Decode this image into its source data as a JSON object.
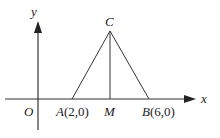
{
  "diagram": {
    "axes": {
      "x_label": "x",
      "y_label": "y",
      "origin_label": "O"
    },
    "points": {
      "A": {
        "name": "A",
        "coords": "(2,0)"
      },
      "B": {
        "name": "B",
        "coords": "(6,0)"
      },
      "C": {
        "name": "C"
      },
      "M": {
        "name": "M"
      }
    },
    "segments": [
      "AC",
      "BC",
      "CM"
    ],
    "colors": {
      "stroke": "#333333",
      "text": "#222222"
    }
  }
}
